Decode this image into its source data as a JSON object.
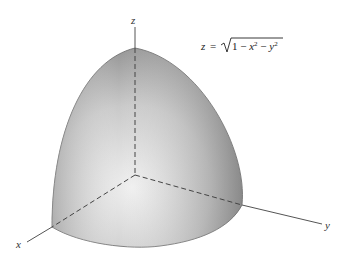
{
  "figure": {
    "equation": {
      "lhs": "z",
      "equals": "=",
      "radicand": "1 − x² − y²",
      "radicand_parts": [
        "1 − ",
        "x",
        "2",
        " − ",
        "y",
        "2"
      ]
    },
    "axes": {
      "x": "x",
      "y": "y",
      "z": "z"
    },
    "surface": "upper hemisphere octant",
    "colors": {
      "surface_light": "#e8e8e8",
      "surface_dark": "#8a8a8a",
      "axis": "#555555",
      "dashed": "#444444"
    }
  }
}
